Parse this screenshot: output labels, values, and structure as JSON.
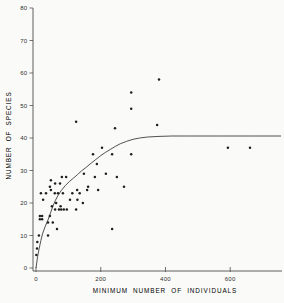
{
  "figure": {
    "background": "#fafaf8",
    "dot_color": "#1f1f1f",
    "curve_color": "#3d3d3d",
    "axis_color": "#4e4e4e",
    "label_color": "#2e2e2e"
  },
  "chart_data": {
    "type": "scatter",
    "title": "",
    "xlabel": "MINIMUM NUMBER OF INDIVIDUALS",
    "ylabel": "NUMBER OF SPECIES",
    "xlim": [
      0,
      760
    ],
    "ylim": [
      0,
      80
    ],
    "x_ticks": [
      0,
      200,
      400,
      600
    ],
    "y_ticks": [
      0,
      10,
      20,
      30,
      40,
      50,
      60,
      70,
      80
    ],
    "grid": false,
    "legend": null,
    "curve_asymptote": 40.5,
    "points": [
      [
        124,
        45
      ],
      [
        294,
        54
      ],
      [
        294,
        49
      ],
      [
        244,
        43
      ],
      [
        380,
        58
      ],
      [
        374,
        44
      ],
      [
        593,
        37
      ],
      [
        661,
        37
      ],
      [
        204,
        37
      ],
      [
        176,
        35
      ],
      [
        235,
        35
      ],
      [
        188,
        32
      ],
      [
        294,
        35
      ],
      [
        272,
        25
      ],
      [
        235,
        12
      ],
      [
        250,
        28
      ],
      [
        80,
        28
      ],
      [
        93,
        28
      ],
      [
        148,
        29
      ],
      [
        182,
        28
      ],
      [
        216,
        29
      ],
      [
        46,
        27
      ],
      [
        59,
        26
      ],
      [
        74,
        26
      ],
      [
        161,
        25
      ],
      [
        43,
        25
      ],
      [
        46,
        24
      ],
      [
        127,
        24
      ],
      [
        158,
        24
      ],
      [
        192,
        24
      ],
      [
        15,
        23
      ],
      [
        31,
        23
      ],
      [
        58,
        23
      ],
      [
        68,
        23
      ],
      [
        83,
        23
      ],
      [
        112,
        23
      ],
      [
        135,
        23
      ],
      [
        22,
        21
      ],
      [
        105,
        21
      ],
      [
        128,
        21
      ],
      [
        49,
        19
      ],
      [
        62,
        20
      ],
      [
        76,
        19
      ],
      [
        145,
        20
      ],
      [
        59,
        18
      ],
      [
        71,
        18
      ],
      [
        78,
        18
      ],
      [
        86,
        18
      ],
      [
        95,
        18
      ],
      [
        124,
        18
      ],
      [
        12,
        16
      ],
      [
        19,
        16
      ],
      [
        12,
        15
      ],
      [
        19,
        15
      ],
      [
        43,
        16
      ],
      [
        37,
        14
      ],
      [
        52,
        14
      ],
      [
        65,
        12
      ],
      [
        37,
        10
      ],
      [
        9,
        10
      ],
      [
        4,
        8
      ],
      [
        3,
        6
      ],
      [
        1,
        4
      ]
    ],
    "fitted_curve": [
      [
        0,
        0
      ],
      [
        5,
        3.5
      ],
      [
        10,
        6
      ],
      [
        15,
        8.5
      ],
      [
        20,
        10.5
      ],
      [
        28,
        12.7
      ],
      [
        37,
        14.8
      ],
      [
        45,
        17
      ],
      [
        52,
        19
      ],
      [
        60,
        20.8
      ],
      [
        68,
        22.3
      ],
      [
        78,
        23.8
      ],
      [
        90,
        25.3
      ],
      [
        103,
        26.6
      ],
      [
        115,
        27.6
      ],
      [
        128,
        28.7
      ],
      [
        140,
        29.8
      ],
      [
        155,
        31
      ],
      [
        170,
        32.2
      ],
      [
        185,
        33.4
      ],
      [
        200,
        34.6
      ],
      [
        215,
        35.6
      ],
      [
        230,
        36.5
      ],
      [
        245,
        37.4
      ],
      [
        260,
        38.2
      ],
      [
        280,
        39
      ],
      [
        300,
        39.6
      ],
      [
        320,
        40
      ],
      [
        345,
        40.3
      ],
      [
        380,
        40.5
      ],
      [
        420,
        40.6
      ],
      [
        480,
        40.6
      ],
      [
        560,
        40.6
      ],
      [
        660,
        40.6
      ],
      [
        757,
        40.6
      ]
    ]
  }
}
